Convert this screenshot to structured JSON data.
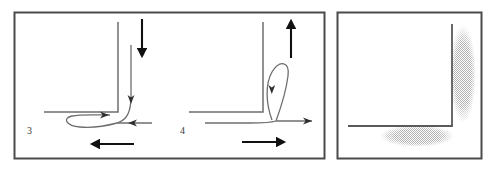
{
  "figure": {
    "width": 495,
    "height": 174,
    "background_color": "#ffffff",
    "frame_color": "#4a4a4a",
    "line_color": "#6e6e6e",
    "bold_arrow_color": "#1a1a1a",
    "stipple_color": "#b9b9b9",
    "panel_count": 3
  },
  "panels": [
    {
      "id": "panel-left",
      "name": "streamline-panel",
      "frame": {
        "x": 14,
        "y": 12,
        "width": 311,
        "height": 147
      },
      "diagrams": [
        {
          "id": "diagram-3",
          "label": "3",
          "label_x": 27,
          "label_y": 134,
          "flow_direction": "downward",
          "bold_arrows": [
            {
              "name": "vertical-bold-arrow",
              "direction": "down",
              "x1": 142,
              "y1": 19,
              "x2": 142,
              "y2": 58
            },
            {
              "name": "horizontal-bold-arrow",
              "direction": "left",
              "x1": 134,
              "y1": 144,
              "x2": 89,
              "y2": 144
            }
          ],
          "thin_arrows": [
            {
              "name": "separation-arrow-right",
              "direction": "right"
            },
            {
              "name": "wall-jet-arrow-down",
              "direction": "down"
            },
            {
              "name": "return-arrow-left",
              "direction": "left"
            }
          ],
          "corner": {
            "vertical_x": 118,
            "horizontal_y": 112
          }
        },
        {
          "id": "diagram-4",
          "label": "4",
          "label_x": 180,
          "label_y": 134,
          "flow_direction": "upward",
          "bold_arrows": [
            {
              "name": "vertical-bold-arrow",
              "direction": "up",
              "x1": 291,
              "y1": 58,
              "x2": 291,
              "y2": 19
            },
            {
              "name": "horizontal-bold-arrow",
              "direction": "right",
              "x1": 242,
              "y1": 142,
              "x2": 287,
              "y2": 142
            }
          ],
          "thin_arrows": [
            {
              "name": "vortex-arrow-down",
              "direction": "down"
            },
            {
              "name": "outflow-arrow-right",
              "direction": "right"
            }
          ],
          "corner": {
            "vertical_x": 263,
            "horizontal_y": 112
          }
        }
      ]
    },
    {
      "id": "panel-right",
      "name": "separation-zone-panel",
      "frame": {
        "x": 337,
        "y": 12,
        "width": 145,
        "height": 147
      },
      "corner": {
        "vertical_x": 452,
        "horizontal_y": 126,
        "top_y": 24,
        "left_x": 348
      },
      "stipple_regions": [
        {
          "name": "vertical-separation-zone",
          "cx": 463,
          "cy": 74,
          "rx": 13,
          "ry": 49
        },
        {
          "name": "horizontal-separation-zone",
          "cx": 417,
          "cy": 136,
          "rx": 37,
          "ry": 11
        }
      ]
    }
  ]
}
